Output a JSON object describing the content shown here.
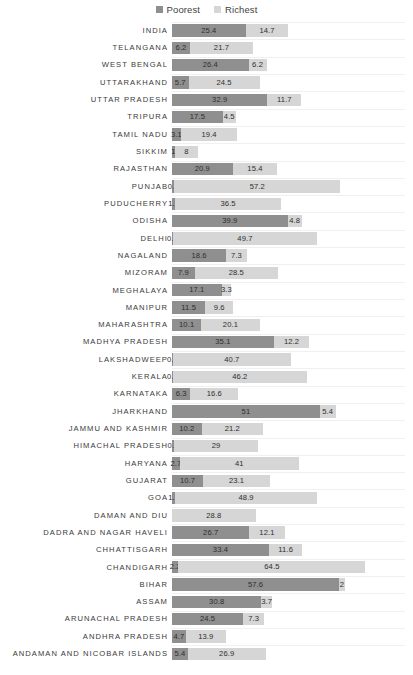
{
  "chart_data": {
    "type": "bar",
    "orientation": "horizontal",
    "stacked": true,
    "title": "",
    "xlabel": "",
    "ylabel": "",
    "grid": true,
    "legend_position": "top-center",
    "xlim": [
      0,
      70
    ],
    "px_per_unit": 2.9,
    "colors": {
      "poorest": "#8f8f8f",
      "richest": "#d6d6d6",
      "background": "#ffffff",
      "gridline": "#f0f0f0",
      "label_text": "#3a3a3a"
    },
    "series": [
      {
        "name": "Poorest",
        "color": "#8f8f8f"
      },
      {
        "name": "Richest",
        "color": "#d6d6d6"
      }
    ],
    "categories": [
      "INDIA",
      "TELANGANA",
      "WEST BENGAL",
      "UTTARAKHAND",
      "UTTAR PRADESH",
      "TRIPURA",
      "TAMIL NADU",
      "SIKKIM",
      "RAJASTHAN",
      "PUNJAB",
      "PUDUCHERRY",
      "ODISHA",
      "DELHI",
      "NAGALAND",
      "MIZORAM",
      "MEGHALAYA",
      "MANIPUR",
      "MAHARASHTRA",
      "MADHYA PRADESH",
      "LAKSHADWEEP",
      "KERALA",
      "KARNATAKA",
      "JHARKHAND",
      "JAMMU AND KASHMIR",
      "HIMACHAL PRADESH",
      "HARYANA",
      "GUJARAT",
      "GOA",
      "DAMAN AND DIU",
      "DADRA AND NAGAR HAVELI",
      "CHHATTISGARH",
      "CHANDIGARH",
      "BIHAR",
      "ASSAM",
      "ARUNACHAL PRADESH",
      "ANDHRA PRADESH",
      "ANDAMAN AND NICOBAR ISLANDS"
    ],
    "poorest": [
      25.4,
      6.2,
      26.4,
      5.7,
      32.9,
      17.5,
      3.1,
      1,
      20.9,
      0.8,
      1.1,
      39.9,
      0.3,
      18.6,
      7.9,
      17.1,
      11.5,
      10.1,
      35.1,
      0.3,
      0.3,
      6.3,
      51,
      10.2,
      0.7,
      2.7,
      10.7,
      1.1,
      0,
      26.7,
      33.4,
      2.2,
      57.6,
      30.8,
      24.5,
      4.7,
      5.4
    ],
    "richest": [
      14.7,
      21.7,
      6.2,
      24.5,
      11.7,
      4.5,
      19.4,
      8,
      15.4,
      57.2,
      36.5,
      4.8,
      49.7,
      7.3,
      28.5,
      3.3,
      9.6,
      20.1,
      12.2,
      40.7,
      46.2,
      16.6,
      5.4,
      21.2,
      29,
      41,
      23.1,
      48.9,
      28.8,
      12.1,
      11.6,
      64.5,
      2,
      3.7,
      7.3,
      13.9,
      26.9
    ],
    "poorest_labels": [
      "25.4",
      "6.2",
      "26.4",
      "5.7",
      "32.9",
      "17.5",
      "3.1",
      "1",
      "20.9",
      "0.8",
      "1.1",
      "39.9",
      "0.3",
      "18.6",
      "7.9",
      "17.1",
      "11.5",
      "10.1",
      "35.1",
      "0.3",
      "0.3",
      "6.3",
      "51",
      "10.2",
      "0.7",
      "2.7",
      "10.7",
      "1.1",
      "",
      "26.7",
      "33.4",
      "2.2",
      "57.6",
      "30.8",
      "24.5",
      "4.7",
      "5.4"
    ],
    "richest_labels": [
      "14.7",
      "21.7",
      "6.2",
      "24.5",
      "11.7",
      "4.5",
      "19.4",
      "8",
      "15.4",
      "57.2",
      "36.5",
      "4.8",
      "49.7",
      "7.3",
      "28.5",
      "3.3",
      "9.6",
      "20.1",
      "12.2",
      "40.7",
      "46.2",
      "16.6",
      "5.4",
      "21.2",
      "29",
      "41",
      "23.1",
      "48.9",
      "28.8",
      "12.1",
      "11.6",
      "64.5",
      "2",
      "3.7",
      "7.3",
      "13.9",
      "26.9"
    ]
  },
  "legend": {
    "items": [
      {
        "label": "Poorest",
        "color": "#8f8f8f"
      },
      {
        "label": "Richest",
        "color": "#d6d6d6"
      }
    ]
  }
}
